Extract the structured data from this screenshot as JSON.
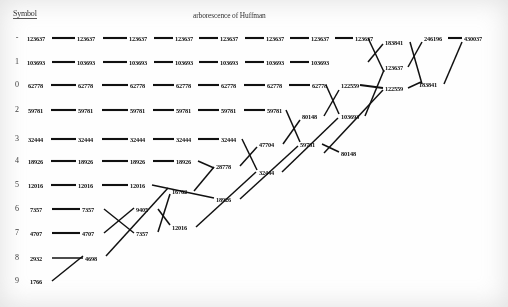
{
  "header": {
    "symbol_column_label": "Symbol",
    "diagram_title": "arborescence of Huffman"
  },
  "symbols": [
    "-",
    "1",
    "0",
    "2",
    "3",
    "4",
    "5",
    "6",
    "7",
    "8",
    "9"
  ],
  "leaf_values": [
    "123637",
    "103693",
    "62778",
    "59781",
    "32444",
    "18926",
    "12016",
    "7357",
    "4707",
    "2932",
    "1766"
  ],
  "chart_data": {
    "type": "diagram",
    "title": "arborescence of Huffman",
    "columns_label": "merge stages",
    "rows": [
      {
        "symbol": "-",
        "weight": 123637,
        "carried": [
          "123637",
          "123637",
          "123637",
          "123637",
          "123637",
          "123637",
          "123637",
          "123637"
        ]
      },
      {
        "symbol": "1",
        "weight": 103693,
        "carried": [
          "103693",
          "103693",
          "103693",
          "103693",
          "103693",
          "103693",
          "103693"
        ]
      },
      {
        "symbol": "0",
        "weight": 62778,
        "carried": [
          "62778",
          "62778",
          "62778",
          "62778",
          "62778",
          "62778",
          "62778"
        ]
      },
      {
        "symbol": "2",
        "weight": 59781,
        "carried": [
          "59781",
          "59781",
          "59781",
          "59781",
          "59781",
          "59781"
        ]
      },
      {
        "symbol": "3",
        "weight": 32444,
        "carried": [
          "32444",
          "32444",
          "32444",
          "32444",
          "32444"
        ]
      },
      {
        "symbol": "4",
        "weight": 18926,
        "carried": [
          "18926",
          "18926",
          "18926",
          "18926"
        ]
      },
      {
        "symbol": "5",
        "weight": 12016,
        "carried": [
          "12016",
          "12016",
          "12016"
        ]
      },
      {
        "symbol": "6",
        "weight": 7357,
        "carried": [
          "7357",
          "7357"
        ]
      },
      {
        "symbol": "7",
        "weight": 4707,
        "carried": [
          "4707",
          "4707"
        ]
      },
      {
        "symbol": "8",
        "weight": 2932,
        "carried": [
          "2932"
        ]
      },
      {
        "symbol": "9",
        "weight": 1766,
        "carried": [
          "1766"
        ]
      }
    ],
    "merge_nodes": [
      "4698",
      "7357",
      "9405",
      "12016",
      "16762",
      "18926",
      "28778",
      "32444",
      "47704",
      "59781",
      "80148",
      "103693",
      "122559",
      "122559",
      "123637",
      "183841",
      "246196",
      "430037"
    ],
    "root": "430037"
  },
  "nodes": [
    {
      "id": "r1c1",
      "text": "123637",
      "x": 27,
      "y": 38
    },
    {
      "id": "r1c2",
      "text": "123637",
      "x": 77,
      "y": 38
    },
    {
      "id": "r1c3",
      "text": "123637",
      "x": 129,
      "y": 38
    },
    {
      "id": "r1c4",
      "text": "123637",
      "x": 175,
      "y": 38
    },
    {
      "id": "r1c5",
      "text": "123637",
      "x": 220,
      "y": 38
    },
    {
      "id": "r1c6",
      "text": "123637",
      "x": 266,
      "y": 38
    },
    {
      "id": "r1c7",
      "text": "123637",
      "x": 311,
      "y": 38
    },
    {
      "id": "r1c8",
      "text": "123637",
      "x": 355,
      "y": 38
    },
    {
      "id": "m183841a",
      "text": "183841",
      "x": 385,
      "y": 42
    },
    {
      "id": "m246196",
      "text": "246196",
      "x": 424,
      "y": 38
    },
    {
      "id": "m430037",
      "text": "430037",
      "x": 464,
      "y": 38
    },
    {
      "id": "r2c1",
      "text": "103693",
      "x": 27,
      "y": 62
    },
    {
      "id": "r2c2",
      "text": "103693",
      "x": 77,
      "y": 62
    },
    {
      "id": "r2c3",
      "text": "103693",
      "x": 129,
      "y": 62
    },
    {
      "id": "r2c4",
      "text": "103693",
      "x": 175,
      "y": 62
    },
    {
      "id": "r2c5",
      "text": "103693",
      "x": 220,
      "y": 62
    },
    {
      "id": "r2c6",
      "text": "103693",
      "x": 266,
      "y": 62
    },
    {
      "id": "r2c7",
      "text": "103693",
      "x": 311,
      "y": 62
    },
    {
      "id": "m123637b",
      "text": "123637",
      "x": 385,
      "y": 67
    },
    {
      "id": "r3c1",
      "text": "62778",
      "x": 28,
      "y": 85
    },
    {
      "id": "r3c2",
      "text": "62778",
      "x": 78,
      "y": 85
    },
    {
      "id": "r3c3",
      "text": "62778",
      "x": 130,
      "y": 85
    },
    {
      "id": "r3c4",
      "text": "62778",
      "x": 176,
      "y": 85
    },
    {
      "id": "r3c5",
      "text": "62778",
      "x": 221,
      "y": 85
    },
    {
      "id": "r3c6",
      "text": "62778",
      "x": 267,
      "y": 85
    },
    {
      "id": "r3c7",
      "text": "62778",
      "x": 312,
      "y": 85
    },
    {
      "id": "m122559a",
      "text": "122559",
      "x": 341,
      "y": 85
    },
    {
      "id": "m122559b",
      "text": "122559",
      "x": 385,
      "y": 88
    },
    {
      "id": "m183841b",
      "text": "183841",
      "x": 419,
      "y": 84
    },
    {
      "id": "r4c1",
      "text": "59781",
      "x": 28,
      "y": 110
    },
    {
      "id": "r4c2",
      "text": "59781",
      "x": 78,
      "y": 110
    },
    {
      "id": "r4c3",
      "text": "59781",
      "x": 130,
      "y": 110
    },
    {
      "id": "r4c4",
      "text": "59781",
      "x": 176,
      "y": 110
    },
    {
      "id": "r4c5",
      "text": "59781",
      "x": 221,
      "y": 110
    },
    {
      "id": "r4c6",
      "text": "59781",
      "x": 267,
      "y": 110
    },
    {
      "id": "m80148a",
      "text": "80148",
      "x": 302,
      "y": 116
    },
    {
      "id": "m103693c",
      "text": "103693",
      "x": 341,
      "y": 116
    },
    {
      "id": "r5c1",
      "text": "32444",
      "x": 28,
      "y": 139
    },
    {
      "id": "r5c2",
      "text": "32444",
      "x": 78,
      "y": 139
    },
    {
      "id": "r5c3",
      "text": "32444",
      "x": 130,
      "y": 139
    },
    {
      "id": "r5c4",
      "text": "32444",
      "x": 176,
      "y": 139
    },
    {
      "id": "r5c5",
      "text": "32444",
      "x": 221,
      "y": 139
    },
    {
      "id": "m47704",
      "text": "47704",
      "x": 259,
      "y": 144
    },
    {
      "id": "m59781b",
      "text": "59781",
      "x": 300,
      "y": 144
    },
    {
      "id": "m80148b",
      "text": "80148",
      "x": 341,
      "y": 153
    },
    {
      "id": "r6c1",
      "text": "18926",
      "x": 28,
      "y": 161
    },
    {
      "id": "r6c2",
      "text": "18926",
      "x": 78,
      "y": 161
    },
    {
      "id": "r6c3",
      "text": "18926",
      "x": 130,
      "y": 161
    },
    {
      "id": "r6c4",
      "text": "18926",
      "x": 176,
      "y": 161
    },
    {
      "id": "m28778",
      "text": "28778",
      "x": 216,
      "y": 166
    },
    {
      "id": "r7c1",
      "text": "12016",
      "x": 28,
      "y": 185
    },
    {
      "id": "r7c2",
      "text": "12016",
      "x": 78,
      "y": 185
    },
    {
      "id": "r7c3",
      "text": "12016",
      "x": 130,
      "y": 185
    },
    {
      "id": "m16762",
      "text": "16762",
      "x": 172,
      "y": 191
    },
    {
      "id": "m18926b",
      "text": "18926",
      "x": 216,
      "y": 199
    },
    {
      "id": "m32444b",
      "text": "32444",
      "x": 259,
      "y": 172
    },
    {
      "id": "r8c1",
      "text": "7357",
      "x": 30,
      "y": 209
    },
    {
      "id": "r8c2",
      "text": "7357",
      "x": 82,
      "y": 209
    },
    {
      "id": "m9405",
      "text": "9405",
      "x": 136,
      "y": 209
    },
    {
      "id": "r9c1",
      "text": "4707",
      "x": 30,
      "y": 233
    },
    {
      "id": "r9c2",
      "text": "4707",
      "x": 82,
      "y": 233
    },
    {
      "id": "m7357b",
      "text": "7357",
      "x": 136,
      "y": 233
    },
    {
      "id": "m12016b",
      "text": "12016",
      "x": 172,
      "y": 227
    },
    {
      "id": "r10c1",
      "text": "2932",
      "x": 30,
      "y": 258
    },
    {
      "id": "m4698",
      "text": "4698",
      "x": 85,
      "y": 258
    },
    {
      "id": "r11c1",
      "text": "1766",
      "x": 30,
      "y": 281
    }
  ],
  "links": {
    "horizontal": [
      {
        "x1": 52,
        "y1": 38,
        "x2": 75,
        "y2": 38
      },
      {
        "x1": 103,
        "y1": 38,
        "x2": 127,
        "y2": 38
      },
      {
        "x1": 154,
        "y1": 38,
        "x2": 173,
        "y2": 38
      },
      {
        "x1": 199,
        "y1": 38,
        "x2": 218,
        "y2": 38
      },
      {
        "x1": 245,
        "y1": 38,
        "x2": 264,
        "y2": 38
      },
      {
        "x1": 290,
        "y1": 38,
        "x2": 309,
        "y2": 38
      },
      {
        "x1": 335,
        "y1": 38,
        "x2": 353,
        "y2": 38
      },
      {
        "x1": 52,
        "y1": 62,
        "x2": 75,
        "y2": 62
      },
      {
        "x1": 103,
        "y1": 62,
        "x2": 127,
        "y2": 62
      },
      {
        "x1": 154,
        "y1": 62,
        "x2": 173,
        "y2": 62
      },
      {
        "x1": 199,
        "y1": 62,
        "x2": 218,
        "y2": 62
      },
      {
        "x1": 245,
        "y1": 62,
        "x2": 264,
        "y2": 62
      },
      {
        "x1": 290,
        "y1": 62,
        "x2": 309,
        "y2": 62
      },
      {
        "x1": 51,
        "y1": 85,
        "x2": 76,
        "y2": 85
      },
      {
        "x1": 102,
        "y1": 85,
        "x2": 128,
        "y2": 85
      },
      {
        "x1": 153,
        "y1": 85,
        "x2": 174,
        "y2": 85
      },
      {
        "x1": 198,
        "y1": 85,
        "x2": 219,
        "y2": 85
      },
      {
        "x1": 244,
        "y1": 85,
        "x2": 265,
        "y2": 85
      },
      {
        "x1": 289,
        "y1": 85,
        "x2": 310,
        "y2": 85
      },
      {
        "x1": 51,
        "y1": 110,
        "x2": 76,
        "y2": 110
      },
      {
        "x1": 102,
        "y1": 110,
        "x2": 128,
        "y2": 110
      },
      {
        "x1": 153,
        "y1": 110,
        "x2": 174,
        "y2": 110
      },
      {
        "x1": 198,
        "y1": 110,
        "x2": 219,
        "y2": 110
      },
      {
        "x1": 244,
        "y1": 110,
        "x2": 265,
        "y2": 110
      },
      {
        "x1": 51,
        "y1": 139,
        "x2": 76,
        "y2": 139
      },
      {
        "x1": 102,
        "y1": 139,
        "x2": 128,
        "y2": 139
      },
      {
        "x1": 153,
        "y1": 139,
        "x2": 174,
        "y2": 139
      },
      {
        "x1": 198,
        "y1": 139,
        "x2": 219,
        "y2": 139
      },
      {
        "x1": 51,
        "y1": 161,
        "x2": 76,
        "y2": 161
      },
      {
        "x1": 102,
        "y1": 161,
        "x2": 128,
        "y2": 161
      },
      {
        "x1": 153,
        "y1": 161,
        "x2": 174,
        "y2": 161
      },
      {
        "x1": 51,
        "y1": 185,
        "x2": 76,
        "y2": 185
      },
      {
        "x1": 102,
        "y1": 185,
        "x2": 128,
        "y2": 185
      },
      {
        "x1": 52,
        "y1": 209,
        "x2": 80,
        "y2": 209
      },
      {
        "x1": 52,
        "y1": 233,
        "x2": 80,
        "y2": 233
      },
      {
        "x1": 360,
        "y1": 85,
        "x2": 383,
        "y2": 88
      },
      {
        "x1": 448,
        "y1": 38,
        "x2": 462,
        "y2": 38
      }
    ],
    "diagonal": [
      {
        "x1": 52,
        "y1": 281,
        "x2": 83,
        "y2": 256
      },
      {
        "x1": 52,
        "y1": 258,
        "x2": 83,
        "y2": 258
      },
      {
        "x1": 104,
        "y1": 209,
        "x2": 134,
        "y2": 233
      },
      {
        "x1": 104,
        "y1": 233,
        "x2": 134,
        "y2": 208
      },
      {
        "x1": 106,
        "y1": 256,
        "x2": 168,
        "y2": 188
      },
      {
        "x1": 158,
        "y1": 209,
        "x2": 170,
        "y2": 225
      },
      {
        "x1": 158,
        "y1": 232,
        "x2": 170,
        "y2": 194
      },
      {
        "x1": 152,
        "y1": 185,
        "x2": 214,
        "y2": 198
      },
      {
        "x1": 194,
        "y1": 191,
        "x2": 214,
        "y2": 167
      },
      {
        "x1": 196,
        "y1": 227,
        "x2": 256,
        "y2": 172
      },
      {
        "x1": 198,
        "y1": 161,
        "x2": 214,
        "y2": 168
      },
      {
        "x1": 240,
        "y1": 166,
        "x2": 257,
        "y2": 147
      },
      {
        "x1": 242,
        "y1": 139,
        "x2": 257,
        "y2": 170
      },
      {
        "x1": 240,
        "y1": 199,
        "x2": 298,
        "y2": 146
      },
      {
        "x1": 283,
        "y1": 144,
        "x2": 300,
        "y2": 120
      },
      {
        "x1": 286,
        "y1": 110,
        "x2": 300,
        "y2": 142
      },
      {
        "x1": 282,
        "y1": 172,
        "x2": 338,
        "y2": 118
      },
      {
        "x1": 324,
        "y1": 116,
        "x2": 339,
        "y2": 90
      },
      {
        "x1": 326,
        "y1": 85,
        "x2": 339,
        "y2": 114
      },
      {
        "x1": 322,
        "y1": 144,
        "x2": 339,
        "y2": 152
      },
      {
        "x1": 324,
        "y1": 153,
        "x2": 383,
        "y2": 90
      },
      {
        "x1": 365,
        "y1": 116,
        "x2": 384,
        "y2": 70
      },
      {
        "x1": 368,
        "y1": 38,
        "x2": 384,
        "y2": 72
      },
      {
        "x1": 368,
        "y1": 62,
        "x2": 383,
        "y2": 44
      },
      {
        "x1": 408,
        "y1": 67,
        "x2": 422,
        "y2": 42
      },
      {
        "x1": 410,
        "y1": 42,
        "x2": 422,
        "y2": 84
      },
      {
        "x1": 408,
        "y1": 88,
        "x2": 421,
        "y2": 82
      },
      {
        "x1": 444,
        "y1": 84,
        "x2": 462,
        "y2": 42
      }
    ]
  }
}
